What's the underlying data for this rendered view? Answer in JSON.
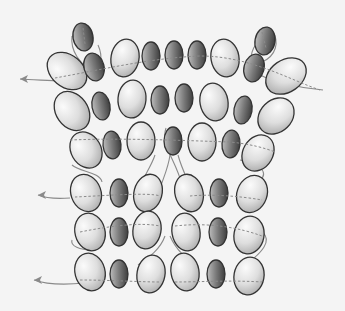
{
  "diagram": {
    "title": "",
    "type": "beadwork thread-path diagram",
    "background": "#f4f4f4",
    "colors": {
      "light_bead_fill_start": "#fbfbfb",
      "light_bead_fill_end": "#a9a9a9",
      "dark_bead_fill_start": "#bdbdbd",
      "dark_bead_fill_end": "#3e3e3e",
      "bead_outline": "#333333",
      "thread": "#8a8a8a"
    },
    "beads": [
      {
        "row": "top-extra",
        "cx": 83,
        "cy": 37,
        "rx": 10,
        "ry": 14,
        "rot": -10,
        "tone": "dark"
      },
      {
        "row": "top-extra",
        "cx": 265,
        "cy": 41,
        "rx": 10,
        "ry": 14,
        "rot": 10,
        "tone": "dark"
      },
      {
        "row": 1,
        "cx": 67,
        "cy": 71,
        "rx": 16,
        "ry": 22,
        "rot": -50,
        "tone": "light"
      },
      {
        "row": 1,
        "cx": 94,
        "cy": 67,
        "rx": 10,
        "ry": 14,
        "rot": -15,
        "tone": "dark"
      },
      {
        "row": 1,
        "cx": 125,
        "cy": 58,
        "rx": 14,
        "ry": 19,
        "rot": 10,
        "tone": "light"
      },
      {
        "row": 1,
        "cx": 151,
        "cy": 56,
        "rx": 9,
        "ry": 14,
        "rot": 0,
        "tone": "dark"
      },
      {
        "row": 1,
        "cx": 174,
        "cy": 55,
        "rx": 9,
        "ry": 14,
        "rot": 0,
        "tone": "dark"
      },
      {
        "row": 1,
        "cx": 197,
        "cy": 55,
        "rx": 9,
        "ry": 14,
        "rot": 0,
        "tone": "dark"
      },
      {
        "row": 1,
        "cx": 225,
        "cy": 58,
        "rx": 14,
        "ry": 19,
        "rot": -10,
        "tone": "light"
      },
      {
        "row": 1,
        "cx": 254,
        "cy": 68,
        "rx": 10,
        "ry": 14,
        "rot": 15,
        "tone": "dark"
      },
      {
        "row": 1,
        "cx": 286,
        "cy": 76,
        "rx": 16,
        "ry": 22,
        "rot": 55,
        "tone": "light"
      },
      {
        "row": 2,
        "cx": 72,
        "cy": 111,
        "rx": 16,
        "ry": 21,
        "rot": -35,
        "tone": "light"
      },
      {
        "row": 2,
        "cx": 101,
        "cy": 106,
        "rx": 9,
        "ry": 14,
        "rot": -10,
        "tone": "dark"
      },
      {
        "row": 2,
        "cx": 132,
        "cy": 99,
        "rx": 14,
        "ry": 19,
        "rot": 5,
        "tone": "light"
      },
      {
        "row": 2,
        "cx": 160,
        "cy": 100,
        "rx": 9,
        "ry": 14,
        "rot": 0,
        "tone": "dark"
      },
      {
        "row": 2,
        "cx": 184,
        "cy": 98,
        "rx": 9,
        "ry": 14,
        "rot": 0,
        "tone": "dark"
      },
      {
        "row": 2,
        "cx": 214,
        "cy": 102,
        "rx": 14,
        "ry": 19,
        "rot": -10,
        "tone": "light"
      },
      {
        "row": 2,
        "cx": 243,
        "cy": 110,
        "rx": 9,
        "ry": 14,
        "rot": 10,
        "tone": "dark"
      },
      {
        "row": 2,
        "cx": 276,
        "cy": 116,
        "rx": 16,
        "ry": 20,
        "rot": 45,
        "tone": "light"
      },
      {
        "row": 3,
        "cx": 86,
        "cy": 150,
        "rx": 15,
        "ry": 19,
        "rot": -30,
        "tone": "light"
      },
      {
        "row": 3,
        "cx": 112,
        "cy": 145,
        "rx": 9,
        "ry": 14,
        "rot": -5,
        "tone": "dark"
      },
      {
        "row": 3,
        "cx": 141,
        "cy": 141,
        "rx": 14,
        "ry": 19,
        "rot": 0,
        "tone": "light"
      },
      {
        "row": 3,
        "cx": 173,
        "cy": 141,
        "rx": 9,
        "ry": 14,
        "rot": 0,
        "tone": "dark"
      },
      {
        "row": 3,
        "cx": 202,
        "cy": 142,
        "rx": 14,
        "ry": 19,
        "rot": 0,
        "tone": "light"
      },
      {
        "row": 3,
        "cx": 231,
        "cy": 144,
        "rx": 9,
        "ry": 14,
        "rot": 5,
        "tone": "dark"
      },
      {
        "row": 3,
        "cx": 258,
        "cy": 153,
        "rx": 15,
        "ry": 19,
        "rot": 30,
        "tone": "light"
      },
      {
        "row": 4,
        "cx": 86,
        "cy": 193,
        "rx": 15,
        "ry": 19,
        "rot": -20,
        "tone": "light"
      },
      {
        "row": 4,
        "cx": 119,
        "cy": 193,
        "rx": 9,
        "ry": 14,
        "rot": 0,
        "tone": "dark"
      },
      {
        "row": 4,
        "cx": 148,
        "cy": 193,
        "rx": 14,
        "ry": 19,
        "rot": 15,
        "tone": "light"
      },
      {
        "row": 4,
        "cx": 189,
        "cy": 193,
        "rx": 14,
        "ry": 19,
        "rot": -15,
        "tone": "light"
      },
      {
        "row": 4,
        "cx": 219,
        "cy": 193,
        "rx": 9,
        "ry": 14,
        "rot": 0,
        "tone": "dark"
      },
      {
        "row": 4,
        "cx": 252,
        "cy": 194,
        "rx": 15,
        "ry": 19,
        "rot": 20,
        "tone": "light"
      },
      {
        "row": 5,
        "cx": 90,
        "cy": 232,
        "rx": 15,
        "ry": 19,
        "rot": -15,
        "tone": "light"
      },
      {
        "row": 5,
        "cx": 119,
        "cy": 232,
        "rx": 9,
        "ry": 14,
        "rot": 0,
        "tone": "dark"
      },
      {
        "row": 5,
        "cx": 147,
        "cy": 230,
        "rx": 14,
        "ry": 19,
        "rot": 10,
        "tone": "light"
      },
      {
        "row": 5,
        "cx": 186,
        "cy": 232,
        "rx": 14,
        "ry": 19,
        "rot": -10,
        "tone": "light"
      },
      {
        "row": 5,
        "cx": 218,
        "cy": 232,
        "rx": 9,
        "ry": 14,
        "rot": 0,
        "tone": "dark"
      },
      {
        "row": 5,
        "cx": 249,
        "cy": 235,
        "rx": 15,
        "ry": 19,
        "rot": 10,
        "tone": "light"
      },
      {
        "row": 6,
        "cx": 90,
        "cy": 272,
        "rx": 15,
        "ry": 19,
        "rot": -15,
        "tone": "light"
      },
      {
        "row": 6,
        "cx": 119,
        "cy": 274,
        "rx": 9,
        "ry": 14,
        "rot": 0,
        "tone": "dark"
      },
      {
        "row": 6,
        "cx": 151,
        "cy": 274,
        "rx": 14,
        "ry": 19,
        "rot": 10,
        "tone": "light"
      },
      {
        "row": 6,
        "cx": 185,
        "cy": 272,
        "rx": 14,
        "ry": 19,
        "rot": -10,
        "tone": "light"
      },
      {
        "row": 6,
        "cx": 216,
        "cy": 274,
        "rx": 9,
        "ry": 14,
        "rot": 0,
        "tone": "dark"
      },
      {
        "row": 6,
        "cx": 249,
        "cy": 276,
        "rx": 15,
        "ry": 19,
        "rot": 10,
        "tone": "light"
      }
    ],
    "threads": {
      "visible": [
        "M 323 90 C 300 88 270 82 250 70",
        "M 72 36 C 70 52 80 62 93 74",
        "M 98 45 C 104 58 100 68 94 79",
        "M 256 44 C 248 56 250 66 256 76",
        "M 272 30 C 280 42 276 56 262 62",
        "M 62 81 C 45 80 30 80 20 79",
        "M 72 165 C 80 172 100 172 102 182",
        "M 240 160 C 268 165 268 178 256 182",
        "M 155 155 C 150 170 140 180 138 195",
        "M 170 155 C 168 170 162 180 158 195",
        "M 178 155 C 182 170 188 180 194 195",
        "M 166 128 C 160 145 176 160 182 185",
        "M 70 198 C 55 199 45 198 38 195",
        "M 72 240 C 70 246 80 250 92 250",
        "M 165 236 C 160 250 148 258 138 265",
        "M 170 236 C 176 250 186 258 195 265",
        "M 262 232 C 272 240 265 252 238 270",
        "M 85 283 C 65 285 45 284 34 280"
      ],
      "hidden": [
        "M 55 78 C 100 70 150 58 200 56 C 250 56 290 80 320 90",
        "M 70 140 C 120 138 170 140 230 142 C 250 144 265 148 275 152",
        "M 75 197 C 100 196 150 192 160 196",
        "M 190 196 C 210 194 240 196 262 200",
        "M 80 232 C 110 226 140 222 160 226",
        "M 175 226 C 210 222 240 228 262 236",
        "M 80 280 C 110 280 140 282 160 282",
        "M 175 282 C 200 282 230 280 262 282",
        "M 83 28 L 85 44",
        "M 262 32 L 266 48"
      ],
      "arrows": [
        {
          "x": 20,
          "y": 79,
          "dir": "left"
        },
        {
          "x": 38,
          "y": 195,
          "dir": "left"
        },
        {
          "x": 34,
          "y": 280,
          "dir": "left"
        }
      ]
    },
    "labels": []
  }
}
